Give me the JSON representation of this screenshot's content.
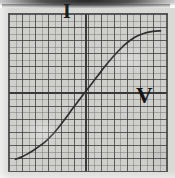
{
  "figure": {
    "kind": "graph-paper-plot"
  },
  "labels": {
    "y_axis": "I",
    "x_axis": "V"
  },
  "colors": {
    "paper": "#d9d9d6",
    "plot_background": "#cfcfcc",
    "grid_minor": "#5c5c5c",
    "grid_major": "#3c3c3c",
    "plot_border": "#575757",
    "axis": "#3a3a3a",
    "curve": "#2e2e2e",
    "label": "#1c1c1c",
    "scan_band": "#141414"
  },
  "chart_data": {
    "type": "line",
    "title": "",
    "subtitle": "",
    "xlabel": "V",
    "ylabel": "I",
    "grid": true,
    "grid_minor_step": 0.5,
    "grid_major_step": 1,
    "legend": null,
    "legend_position": "none",
    "xlim": [
      -5.9,
      6.3
    ],
    "ylim": [
      -6.1,
      6.0
    ],
    "axis_origin": [
      0,
      0
    ],
    "annotations": [
      {
        "text": "I",
        "x": -0.9,
        "y": 5.2,
        "role": "y-axis-label"
      },
      {
        "text": "V",
        "x": 4.6,
        "y": -0.9,
        "role": "x-axis-label"
      }
    ],
    "series": [
      {
        "name": "I-V characteristic",
        "x": [
          -5.4,
          -5.0,
          -4.5,
          -4.0,
          -3.5,
          -3.0,
          -2.5,
          -2.0,
          -1.5,
          -1.0,
          -0.5,
          0.0,
          0.5,
          1.0,
          1.5,
          2.0,
          2.5,
          3.0,
          3.5,
          4.0,
          4.5,
          5.0,
          5.4,
          5.8
        ],
        "y": [
          -5.2,
          -5.05,
          -4.8,
          -4.5,
          -4.15,
          -3.75,
          -3.25,
          -2.65,
          -2.0,
          -1.3,
          -0.65,
          0.0,
          0.65,
          1.3,
          1.95,
          2.55,
          3.1,
          3.6,
          4.0,
          4.3,
          4.5,
          4.62,
          4.68,
          4.7
        ]
      }
    ]
  }
}
